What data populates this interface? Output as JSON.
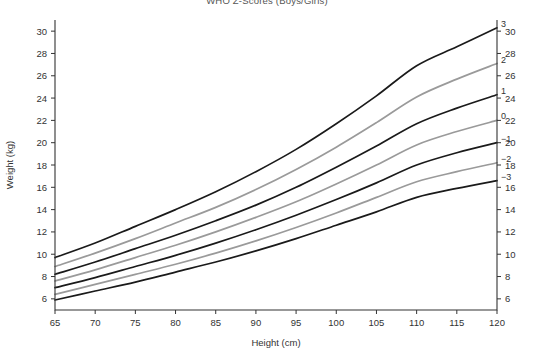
{
  "title": {
    "text": "WHO Z-Scores (Boys/Girls)",
    "note": "clipped at top edge of screenshot"
  },
  "axes": {
    "x": {
      "label": "Height (cm)",
      "min": 65,
      "max": 120,
      "ticks": [
        65,
        70,
        75,
        80,
        85,
        90,
        95,
        100,
        105,
        110,
        115,
        120
      ],
      "tick_labels": [
        "65",
        "70",
        "75",
        "80",
        "85",
        "90",
        "95",
        "100",
        "105",
        "110",
        "115",
        "120"
      ]
    },
    "y_left": {
      "label": "Weight (kg)",
      "min": 5,
      "max": 31,
      "ticks": [
        6,
        8,
        10,
        12,
        14,
        16,
        18,
        20,
        22,
        24,
        26,
        28,
        30
      ],
      "tick_labels": [
        "6",
        "8",
        "10",
        "12",
        "14",
        "16",
        "18",
        "20",
        "22",
        "24",
        "26",
        "28",
        "30"
      ]
    },
    "y_right": {
      "label": "",
      "min": 5,
      "max": 31,
      "ticks": [
        6,
        8,
        10,
        12,
        14,
        16,
        18,
        20,
        22,
        24,
        26,
        28,
        30
      ],
      "tick_labels": [
        "6",
        "8",
        "10",
        "12",
        "14",
        "16",
        "18",
        "20",
        "22",
        "24",
        "26",
        "28",
        "30"
      ]
    }
  },
  "colors": {
    "curve_black": "#1a1a1a",
    "curve_gray": "#9a9a9a",
    "axis": "#333333",
    "text": "#333333",
    "background": "#ffffff"
  },
  "chart_data": {
    "type": "line",
    "title": "WHO Z-Scores (Boys/Girls)",
    "xlabel": "Height (cm)",
    "ylabel": "Weight (kg)",
    "xlim": [
      65,
      120
    ],
    "ylim": [
      5,
      31
    ],
    "grid": false,
    "legend": "inline-right-end-labels",
    "x": [
      65,
      70,
      75,
      80,
      85,
      90,
      95,
      100,
      105,
      110,
      115,
      120
    ],
    "series": [
      {
        "name": "3",
        "label": "3",
        "color": "#1a1a1a",
        "values": [
          9.7,
          11.0,
          12.5,
          14.0,
          15.6,
          17.4,
          19.4,
          21.7,
          24.2,
          26.9,
          28.6,
          30.3
        ]
      },
      {
        "name": "2",
        "label": "2",
        "color": "#9a9a9a",
        "values": [
          8.9,
          10.1,
          11.4,
          12.8,
          14.2,
          15.8,
          17.6,
          19.6,
          21.8,
          24.1,
          25.7,
          27.1
        ]
      },
      {
        "name": "1",
        "label": "1",
        "color": "#1a1a1a",
        "values": [
          8.2,
          9.3,
          10.5,
          11.7,
          13.0,
          14.4,
          16.0,
          17.8,
          19.7,
          21.7,
          23.1,
          24.3
        ]
      },
      {
        "name": "0",
        "label": "0",
        "color": "#9a9a9a",
        "values": [
          7.6,
          8.6,
          9.7,
          10.8,
          12.0,
          13.3,
          14.7,
          16.3,
          18.0,
          19.8,
          21.0,
          22.0
        ]
      },
      {
        "name": "-1",
        "label": "−1",
        "color": "#1a1a1a",
        "values": [
          7.0,
          7.9,
          8.9,
          9.9,
          11.0,
          12.2,
          13.5,
          14.9,
          16.4,
          18.0,
          19.1,
          20.0
        ]
      },
      {
        "name": "-2",
        "label": "−2",
        "color": "#9a9a9a",
        "values": [
          6.4,
          7.3,
          8.2,
          9.1,
          10.1,
          11.2,
          12.4,
          13.7,
          15.1,
          16.5,
          17.4,
          18.2
        ]
      },
      {
        "name": "-3",
        "label": "−3",
        "color": "#1a1a1a",
        "values": [
          5.9,
          6.7,
          7.5,
          8.4,
          9.3,
          10.3,
          11.4,
          12.6,
          13.8,
          15.1,
          15.9,
          16.6
        ]
      }
    ]
  }
}
